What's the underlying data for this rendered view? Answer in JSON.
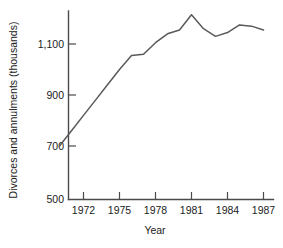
{
  "chart_data": {
    "type": "line",
    "title": "",
    "xlabel": "Year",
    "ylabel": "Divorces and annulments (thousands)",
    "xlim": [
      1970,
      1987
    ],
    "ylim": [
      500,
      1250
    ],
    "grid": false,
    "legend": "none",
    "line_color": "#5a5a5a",
    "axis_color": "#4a4a4a",
    "xticks": [
      1972,
      1975,
      1978,
      1981,
      1984,
      1987
    ],
    "xtick_labels": [
      "1972",
      "1975",
      "1978",
      "1981",
      "1984",
      "1987"
    ],
    "yticks": [
      500,
      700,
      900,
      1100
    ],
    "ytick_labels": [
      "500",
      "700",
      "900",
      "1,100"
    ],
    "x": [
      1970,
      1971,
      1972,
      1973,
      1974,
      1975,
      1976,
      1977,
      1978,
      1979,
      1980,
      1981,
      1982,
      1983,
      1984,
      1985,
      1986,
      1987
    ],
    "values": [
      700,
      760,
      820,
      880,
      940,
      1000,
      1055,
      1060,
      1105,
      1140,
      1155,
      1215,
      1160,
      1130,
      1145,
      1175,
      1170,
      1155
    ],
    "series": [
      {
        "name": "Divorces and annulments",
        "values": [
          700,
          760,
          820,
          880,
          940,
          1000,
          1055,
          1060,
          1105,
          1140,
          1155,
          1215,
          1160,
          1130,
          1145,
          1175,
          1170,
          1155
        ]
      }
    ],
    "annotations": []
  },
  "figure": {
    "caption": ""
  }
}
